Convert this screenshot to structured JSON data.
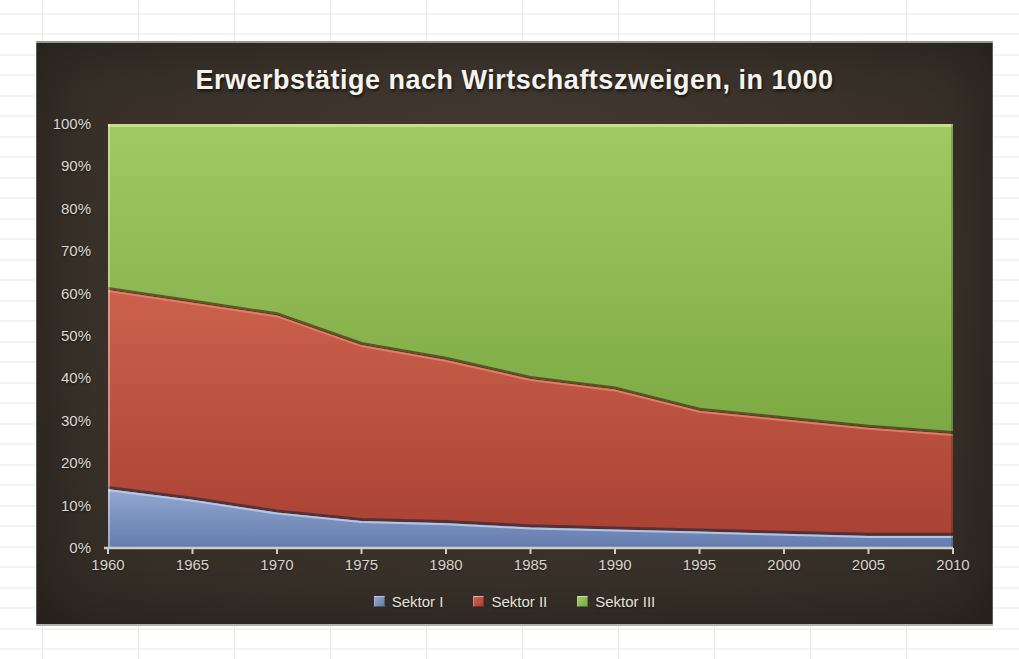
{
  "chart": {
    "title": "Erwerbstätige nach Wirtschaftszweigen, in 1000"
  },
  "colors": {
    "frame_background": "#3b332b",
    "axis_line": "#cfccc5",
    "axis_text": "#d6d3cc",
    "title_text": "#f5f3ed"
  },
  "chart_data": {
    "type": "area",
    "stacked": true,
    "normalized": "percent",
    "title": "Erwerbstätige nach Wirtschaftszweigen, in 1000",
    "x": [
      1960,
      1965,
      1970,
      1975,
      1980,
      1985,
      1990,
      1995,
      2000,
      2005,
      2010
    ],
    "x_tick_labels": [
      "1960",
      "1965",
      "1970",
      "1975",
      "1980",
      "1985",
      "1990",
      "1995",
      "2000",
      "2005",
      "2010"
    ],
    "y_tick_labels": [
      "0%",
      "10%",
      "20%",
      "30%",
      "40%",
      "50%",
      "60%",
      "70%",
      "80%",
      "90%",
      "100%"
    ],
    "ylim": [
      0,
      100
    ],
    "y_tick_step": 10,
    "grid": false,
    "legend_position": "bottom-center",
    "series": [
      {
        "name": "Sektor I",
        "values": [
          14,
          11.5,
          8.5,
          6.5,
          6,
          5,
          4.5,
          4,
          3.5,
          3,
          3
        ],
        "color": "#7189bb",
        "fill_top": "#94a8d1",
        "fill_bottom": "#637bad",
        "edge_highlight": "#bccbe6",
        "edge_shadow": "rgba(25,30,50,0.55)"
      },
      {
        "name": "Sektor II",
        "values": [
          47,
          46.5,
          46.5,
          41.5,
          38.5,
          35,
          33,
          28.5,
          27,
          25.5,
          24
        ],
        "color": "#c1503f",
        "fill_top": "#cc614d",
        "fill_bottom": "#aa4234",
        "edge_highlight": "#e2816a",
        "edge_shadow": "rgba(60,25,15,0.6)"
      },
      {
        "name": "Sektor III",
        "values": [
          39,
          42,
          45,
          52,
          55.5,
          60,
          62.5,
          67.5,
          69.5,
          71.5,
          73
        ],
        "color": "#8dbc50",
        "fill_top": "#a1c964",
        "fill_bottom": "#7ca943",
        "edge_highlight": "#cbe494",
        "edge_shadow": "rgba(40,50,15,0.45)"
      }
    ]
  }
}
